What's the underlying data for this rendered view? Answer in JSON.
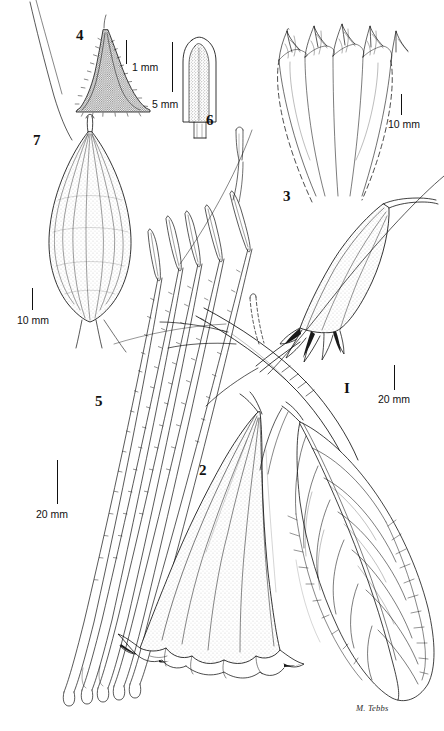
{
  "plate": {
    "title": "Botanical line drawing plate",
    "subject": "Brugmansia (angel's trumpet) — habit, flower, calyx, corolla lobe, stamens, anther, fruit",
    "background_color": "#ffffff",
    "ink_color": "#111111",
    "width": 444,
    "height": 731,
    "signature": "M. Tebbs"
  },
  "figures": [
    {
      "id": "1",
      "label": "I",
      "name": "flowering-branch-with-bud",
      "description": "Flowering branch bearing a long pendulous bud with reflexed calyx and a leaf"
    },
    {
      "id": "2",
      "label": "2",
      "name": "corolla-trumpet",
      "description": "Large trumpet-shaped corolla, flared and frilled at mouth"
    },
    {
      "id": "3",
      "label": "3",
      "name": "corolla-lobes-detail",
      "description": "Spread corolla limb showing five acuminate lobes with venation, dashed outline"
    },
    {
      "id": "4",
      "label": "4",
      "name": "anther-detail",
      "description": "Pubescent anther / hair-covered apex detail"
    },
    {
      "id": "5",
      "label": "5",
      "name": "stamen-bundle",
      "description": "Bundle of five long stamens with hairy filaments and elongate anthers"
    },
    {
      "id": "6",
      "label": "6",
      "name": "anther-enlarged",
      "description": "Single enlarged anther, clavate with rounded apex"
    },
    {
      "id": "7",
      "label": "7",
      "name": "fruit-capsule",
      "description": "Ovoid ribbed and stippled fruit / capsule"
    }
  ],
  "scale_bars": [
    {
      "id": "sb-1mm",
      "name": "scale-bar-1mm-fig4",
      "label": "1 mm",
      "for_figure": "4"
    },
    {
      "id": "sb-5mm",
      "name": "scale-bar-5mm-fig6",
      "label": "5 mm",
      "for_figure": "6"
    },
    {
      "id": "sb-10mm-fig3",
      "name": "scale-bar-10mm-fig3",
      "label": "10 mm",
      "for_figure": "3"
    },
    {
      "id": "sb-10mm-fig7",
      "name": "scale-bar-10mm-fig7",
      "label": "10 mm",
      "for_figure": "7"
    },
    {
      "id": "sb-20mm-fig5",
      "name": "scale-bar-20mm-fig5",
      "label": "20 mm",
      "for_figure": "5"
    },
    {
      "id": "sb-20mm-fig1",
      "name": "scale-bar-20mm-fig1",
      "label": "20 mm",
      "for_figure": "1"
    }
  ]
}
